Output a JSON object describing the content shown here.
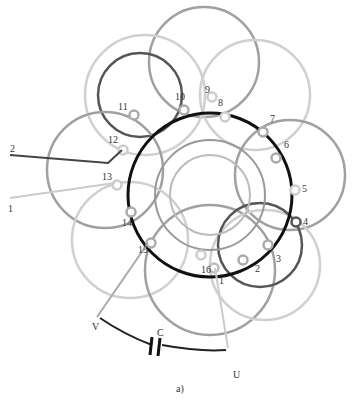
{
  "diagram": {
    "caption": "a)",
    "slot_labels": [
      "1",
      "2",
      "3",
      "4",
      "5",
      "6",
      "7",
      "8",
      "9",
      "10",
      "11",
      "12",
      "13",
      "14",
      "15",
      "16"
    ],
    "terminals": {
      "v": "V",
      "u": "U",
      "capacitor": "C",
      "lead_2": "2",
      "lead_1": "1"
    },
    "colors": {
      "black": "#111111",
      "dark": "#444444",
      "mid": "#9a9a9a",
      "light": "#c8c8c8"
    }
  }
}
